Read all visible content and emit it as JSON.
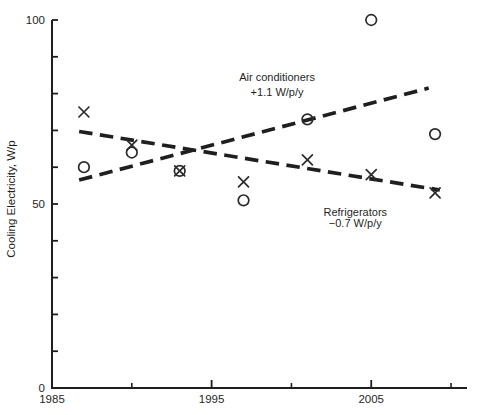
{
  "figure": {
    "background": "#ffffff",
    "ink_color": "#1f1f1f",
    "marker_color": "#2b2b2b"
  },
  "chart_data": {
    "type": "scatter",
    "title": "",
    "xlabel": "",
    "ylabel": "Cooling Electricity, W/p",
    "xlim": [
      1985,
      2011
    ],
    "ylim": [
      0,
      100
    ],
    "x_labeled_ticks": [
      1985,
      1995,
      2005
    ],
    "x_minor_ticks": [
      1990,
      2000,
      2010
    ],
    "y_tick_step": 10,
    "y_labeled_ticks": [
      0,
      50,
      100
    ],
    "grid": false,
    "legend_position": "inline-annotations",
    "series": [
      {
        "name": "Air conditioners",
        "marker": "circle",
        "trend_style": "dashed",
        "slope_label": "+1.1 W/p/y",
        "points": [
          [
            1987,
            60
          ],
          [
            1990,
            64
          ],
          [
            1993,
            59
          ],
          [
            1997,
            51
          ],
          [
            2001,
            73
          ],
          [
            2005,
            100
          ],
          [
            2009,
            69
          ]
        ],
        "trend": {
          "x1": 1986.7,
          "y1": 56.5,
          "x2": 2008.6,
          "y2": 81.5
        },
        "annotation": {
          "line1": "Air conditioners",
          "line2": "+1.1 W/p/y",
          "x": 1999.1,
          "y1": 83.5,
          "y2": 79.3
        }
      },
      {
        "name": "Refrigerators",
        "marker": "x",
        "trend_style": "dashed",
        "slope_label": "−0.7 W/p/y",
        "points": [
          [
            1987,
            75
          ],
          [
            1990,
            66
          ],
          [
            1993,
            59
          ],
          [
            1997,
            56
          ],
          [
            2001,
            62
          ],
          [
            2005,
            58
          ],
          [
            2009,
            53
          ]
        ],
        "trend": {
          "x1": 1986.7,
          "y1": 69.7,
          "x2": 2009.3,
          "y2": 53.8
        },
        "annotation": {
          "line1": "Refrigerators",
          "line2": "−0.7 W/p/y",
          "x": 2004.0,
          "y1": 46.7,
          "y2": 43.7
        }
      }
    ]
  }
}
